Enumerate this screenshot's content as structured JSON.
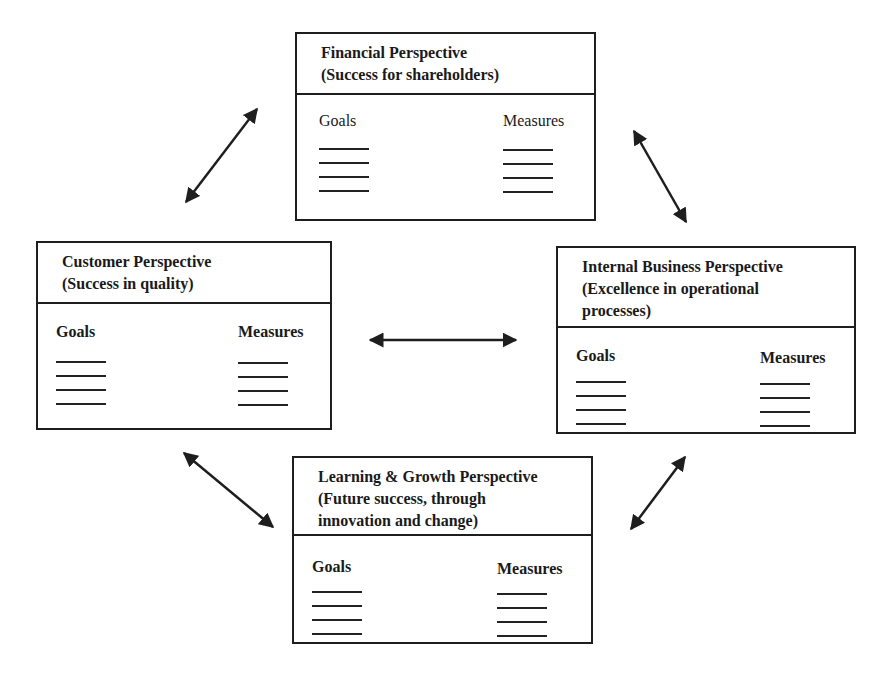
{
  "diagram": {
    "type": "balanced-scorecard",
    "boxes": {
      "financial": {
        "title": "Financial Perspective",
        "subtitle": "(Success for shareholders)",
        "goals_label": "Goals",
        "measures_label": "Measures"
      },
      "customer": {
        "title": "Customer Perspective",
        "subtitle": "(Success in quality)",
        "goals_label": "Goals",
        "measures_label": "Measures"
      },
      "internal": {
        "title": "Internal Business Perspective",
        "subtitle_line1": "(Excellence in operational",
        "subtitle_line2": "processes)",
        "goals_label": "Goals",
        "measures_label": "Measures"
      },
      "learning": {
        "title": "Learning & Growth Perspective",
        "subtitle_line1": "(Future success, through",
        "subtitle_line2": "innovation and change)",
        "goals_label": "Goals",
        "measures_label": "Measures"
      }
    },
    "connections": [
      {
        "from": "customer",
        "to": "financial",
        "type": "bidirectional-arrow"
      },
      {
        "from": "financial",
        "to": "internal",
        "type": "bidirectional-arrow"
      },
      {
        "from": "customer",
        "to": "internal",
        "type": "bidirectional-arrow"
      },
      {
        "from": "customer",
        "to": "learning",
        "type": "bidirectional-arrow"
      },
      {
        "from": "learning",
        "to": "internal",
        "type": "bidirectional-arrow"
      }
    ],
    "placeholder_lines_per_column": 4,
    "line_color": "#1e1e1e"
  }
}
